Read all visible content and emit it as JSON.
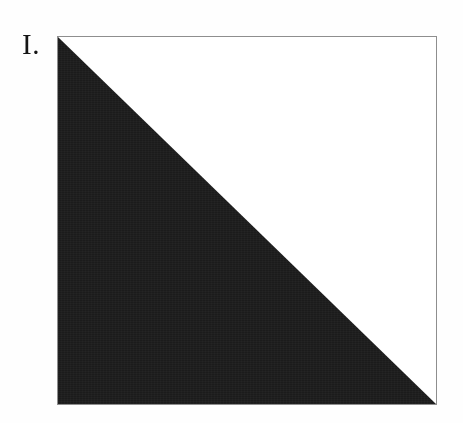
{
  "figure": {
    "label": "I.",
    "caption_position": "left-of-frame",
    "frame": {
      "name": "square-frame",
      "border_color": "#8e8e8e",
      "border_width_px": 1,
      "background_color": "#ffffff",
      "x": 57,
      "y": 36,
      "width": 380,
      "height": 369
    },
    "shapes": [
      {
        "name": "filled-triangle",
        "type": "triangle",
        "description": "lower-left right triangle filling half the square, hypotenuse from top-left corner to bottom-right corner",
        "fill_color": "#1b1b1b",
        "texture": "grainy-halftone",
        "points": "0,0 0,100 100,100"
      },
      {
        "name": "empty-triangle",
        "type": "triangle",
        "description": "upper-right right triangle left blank",
        "fill_color": "#ffffff",
        "points": "0,0 100,0 100,100"
      }
    ],
    "page_background": "#fefefe",
    "text_color": "#151515"
  }
}
